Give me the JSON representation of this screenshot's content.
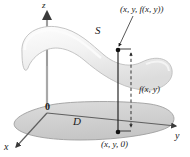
{
  "figure": {
    "background_color": "#ffffff",
    "axes": {
      "z_label": "z",
      "x_label": "x",
      "y_label": "y",
      "origin_label": "0",
      "axis_color": "#5a5a5a"
    },
    "surface": {
      "label": "S",
      "fill_color": "#ededed",
      "edge_color": "#b8b8b8",
      "highlight_color": "#fbfbfb"
    },
    "domain": {
      "label": "D",
      "fill_color": "#d2d2d2",
      "edge_color": "#9a9a9a"
    },
    "points": {
      "upper_label": "(x, y, f(x, y))",
      "lower_label": "(x, y, 0)",
      "marker_color": "#111111"
    },
    "measure": {
      "label": "f(x, y)",
      "line_style": "dashed",
      "line_color": "#2b2b2b"
    },
    "connector": {
      "style": "solid",
      "color": "#1f1f1f"
    },
    "leader_line": {
      "style": "solid",
      "color": "#3a3a3a"
    }
  }
}
